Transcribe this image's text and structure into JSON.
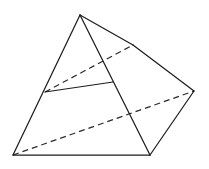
{
  "figure": {
    "title": "",
    "kind": "3d-solid-wireframe",
    "canvas": {
      "width": 209,
      "height": 169,
      "background": "#ffffff"
    },
    "style": {
      "solid_stroke": "#1d1d1d",
      "hidden_stroke": "#2a2a2a",
      "solid_width": 1.25,
      "hidden_width": 1.2,
      "hidden_dasharray": "6 4"
    },
    "vertices": [
      {
        "id": "apex",
        "name": "apex-vertex",
        "x": 80,
        "y": 15
      },
      {
        "id": "upper-right",
        "name": "upper-right-vertex",
        "x": 133,
        "y": 45
      },
      {
        "id": "mid-left",
        "name": "mid-left-vertex",
        "x": 45,
        "y": 92
      },
      {
        "id": "mid-center",
        "name": "mid-center-vertex",
        "x": 113,
        "y": 82
      },
      {
        "id": "far-right",
        "name": "far-right-vertex",
        "x": 194,
        "y": 91
      },
      {
        "id": "bottom-left",
        "name": "bottom-left-vertex",
        "x": 13,
        "y": 155
      },
      {
        "id": "bottom-right",
        "name": "bottom-right-vertex",
        "x": 150,
        "y": 155
      }
    ],
    "solid_edges": [
      {
        "name": "edge-apex-to-bottom-left",
        "x1": 80,
        "y1": 15,
        "x2": 13,
        "y2": 155
      },
      {
        "name": "edge-apex-to-bottom-right",
        "x1": 80,
        "y1": 15,
        "x2": 150,
        "y2": 155
      },
      {
        "name": "edge-apex-to-upper-right",
        "x1": 80,
        "y1": 15,
        "x2": 133,
        "y2": 45
      },
      {
        "name": "edge-upper-right-to-far-right",
        "x1": 133,
        "y1": 45,
        "x2": 194,
        "y2": 91
      },
      {
        "name": "edge-far-right-to-bottom-right",
        "x1": 194,
        "y1": 91,
        "x2": 150,
        "y2": 155
      },
      {
        "name": "edge-bottom-left-to-bottom-right",
        "x1": 13,
        "y1": 155,
        "x2": 150,
        "y2": 155
      },
      {
        "name": "edge-mid-left-to-mid-center",
        "x1": 45,
        "y1": 92,
        "x2": 113,
        "y2": 82
      }
    ],
    "hidden_edges": [
      {
        "name": "hidden-edge-mid-left-to-upper-right",
        "x1": 45,
        "y1": 92,
        "x2": 133,
        "y2": 45
      },
      {
        "name": "hidden-edge-bottom-left-to-far-right",
        "x1": 13,
        "y1": 155,
        "x2": 194,
        "y2": 91
      }
    ]
  }
}
